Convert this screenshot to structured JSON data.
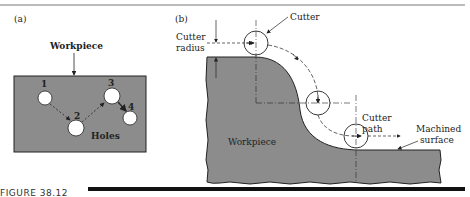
{
  "figure": {
    "caption": "FIGURE 38.12",
    "panel_a": {
      "label": "(a)",
      "workpiece_label": "Workpiece",
      "holes_label": "Holes",
      "hole_numbers": [
        "1",
        "2",
        "3",
        "4"
      ]
    },
    "panel_b": {
      "label": "(b)",
      "cutter_label": "Cutter",
      "cutter_radius_label_line1": "Cutter",
      "cutter_radius_label_line2": "radius",
      "workpiece_label": "Workpiece",
      "cutter_path_label_line1": "Cutter",
      "cutter_path_label_line2": "path",
      "machined_surface_label_line1": "Machined",
      "machined_surface_label_line2": "surface"
    },
    "colors": {
      "workpiece_fill": "#8c8c8c",
      "outline": "#222222",
      "hole_fill": "#ffffff"
    }
  }
}
